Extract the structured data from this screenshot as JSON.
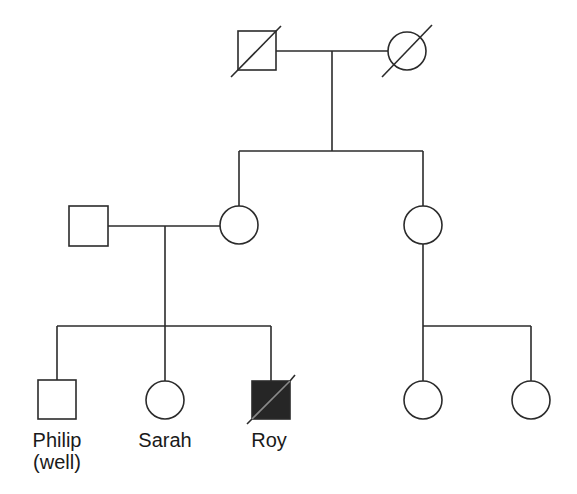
{
  "diagram": {
    "type": "pedigree",
    "colors": {
      "stroke": "#2b2b2b",
      "affected_fill": "#262626",
      "background": "#ffffff"
    },
    "generations": [
      {
        "level": "I",
        "members": [
          {
            "id": "grandfather",
            "sex": "male",
            "deceased": true,
            "affected": false,
            "label": ""
          },
          {
            "id": "grandmother",
            "sex": "female",
            "deceased": true,
            "affected": false,
            "label": ""
          }
        ]
      },
      {
        "level": "II",
        "members": [
          {
            "id": "father",
            "sex": "male",
            "deceased": false,
            "affected": false,
            "label": ""
          },
          {
            "id": "mother",
            "sex": "female",
            "deceased": false,
            "affected": false,
            "label": ""
          },
          {
            "id": "aunt",
            "sex": "female",
            "deceased": false,
            "affected": false,
            "label": ""
          }
        ]
      },
      {
        "level": "III",
        "members": [
          {
            "id": "philip",
            "sex": "male",
            "deceased": false,
            "affected": false,
            "label": "Philip",
            "note": "(well)"
          },
          {
            "id": "sarah",
            "sex": "female",
            "deceased": false,
            "affected": false,
            "label": "Sarah"
          },
          {
            "id": "roy",
            "sex": "male",
            "deceased": true,
            "affected": true,
            "label": "Roy"
          },
          {
            "id": "cousin-1",
            "sex": "female",
            "deceased": false,
            "affected": false,
            "label": ""
          },
          {
            "id": "cousin-2",
            "sex": "female",
            "deceased": false,
            "affected": false,
            "label": ""
          }
        ]
      }
    ],
    "relationships": [
      {
        "type": "marriage",
        "between": [
          "grandfather",
          "grandmother"
        ],
        "children": [
          "mother",
          "aunt"
        ]
      },
      {
        "type": "marriage",
        "between": [
          "father",
          "mother"
        ],
        "children": [
          "philip",
          "sarah",
          "roy"
        ]
      },
      {
        "type": "single-parent-line",
        "parent": "aunt",
        "children": [
          "cousin-1",
          "cousin-2"
        ]
      }
    ]
  },
  "labels": {
    "philip": "Philip",
    "philip_note": "(well)",
    "sarah": "Sarah",
    "roy": "Roy"
  }
}
